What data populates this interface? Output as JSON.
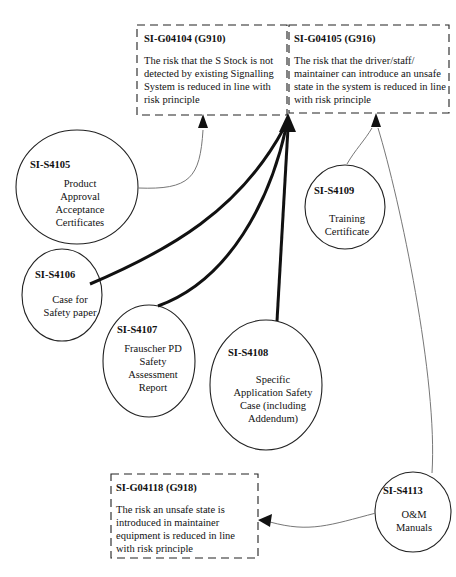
{
  "goals": [
    {
      "id": "SI-G04104 (G910)",
      "text": "The risk that the S Stock is not detected by existing Signalling System is reduced in line with risk principle"
    },
    {
      "id": "SI-G04105 (G916)",
      "text": "The risk that the driver/staff/ maintainer can introduce an unsafe state in the system is reduced in line with risk principle"
    },
    {
      "id": "SI-G04118 (G918)",
      "text": "The risk an unsafe state is introduced in maintainer equipment is reduced in line with risk principle"
    }
  ],
  "solutions": [
    {
      "id": "SI-S4105",
      "lines": [
        "Product",
        "Approval",
        "Acceptance",
        "Certificates"
      ]
    },
    {
      "id": "SI-S4106",
      "lines": [
        "Case for",
        "Safety paper"
      ]
    },
    {
      "id": "SI-S4107",
      "lines": [
        "Frauscher PD",
        "Safety",
        "Assessment",
        "Report"
      ]
    },
    {
      "id": "SI-S4108",
      "lines": [
        "Specific",
        "Application Safety",
        "Case (including",
        "Addendum)"
      ]
    },
    {
      "id": "SI-S4109",
      "lines": [
        "Training",
        "Certificate"
      ]
    },
    {
      "id": "SI-S4113",
      "lines": [
        "O&M",
        "Manuals"
      ]
    }
  ],
  "colors": {
    "line": "#111111",
    "thin_line": "#777777",
    "border": "#222222",
    "background": "#ffffff"
  }
}
